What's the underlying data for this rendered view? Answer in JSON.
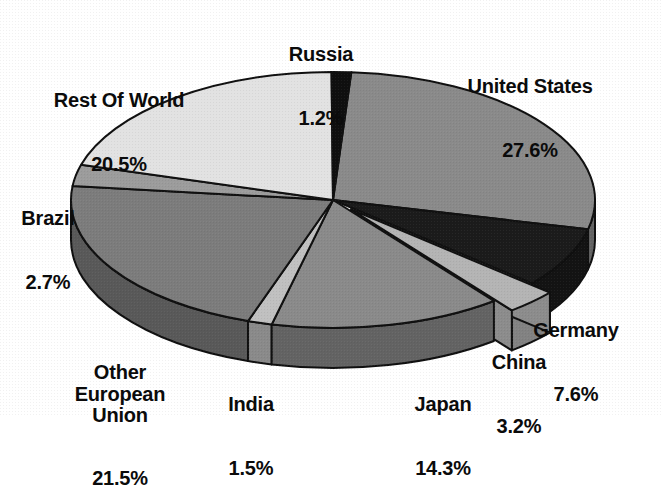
{
  "chart_title": "",
  "chart_data": {
    "type": "pie",
    "title": "",
    "subtitle": "",
    "xlabel": "",
    "ylabel": "",
    "units": "percent",
    "legend_position": "none",
    "labels_outside": true,
    "three_d": true,
    "grid": false,
    "start_angle_deg": 4,
    "direction": "clockwise",
    "categories": [
      "United States",
      "Germany",
      "China",
      "Japan",
      "India",
      "Other European Union",
      "Brazil",
      "Rest Of World",
      "Russia"
    ],
    "values": [
      27.6,
      7.6,
      3.2,
      14.3,
      1.5,
      21.5,
      2.7,
      20.5,
      1.2
    ],
    "total": 100.1,
    "slices": [
      {
        "name": "United States",
        "value": 27.6,
        "label": "United States",
        "percent_text": "27.6%",
        "fill": "#8a8a8a",
        "exploded": false
      },
      {
        "name": "Germany",
        "value": 7.6,
        "label": "Germany",
        "percent_text": "7.6%",
        "fill": "#1b1b1b",
        "exploded": false
      },
      {
        "name": "China",
        "value": 3.2,
        "label": "China",
        "percent_text": "3.2%",
        "fill": "#b4b4b4",
        "exploded": true
      },
      {
        "name": "Japan",
        "value": 14.3,
        "label": "Japan",
        "percent_text": "14.3%",
        "fill": "#8a8a8a",
        "exploded": false
      },
      {
        "name": "India",
        "value": 1.5,
        "label": "India",
        "percent_text": "1.5%",
        "fill": "#c0c0c0",
        "exploded": false
      },
      {
        "name": "Other European Union",
        "value": 21.5,
        "label": "Other\nEuropean\nUnion",
        "percent_text": "21.5%",
        "fill": "#7c7c7c",
        "exploded": false
      },
      {
        "name": "Brazil",
        "value": 2.7,
        "label": "Brazil",
        "percent_text": "2.7%",
        "fill": "#9c9c9c",
        "exploded": false
      },
      {
        "name": "Rest Of World",
        "value": 20.5,
        "label": "Rest Of World",
        "percent_text": "20.5%",
        "fill": "#e2e2e2",
        "exploded": false
      },
      {
        "name": "Russia",
        "value": 1.2,
        "label": "Russia",
        "percent_text": "1.2%",
        "fill": "#0f0f0f",
        "exploded": false
      }
    ]
  },
  "labels": {
    "united_states": {
      "name": "United States",
      "pct": "27.6%"
    },
    "germany": {
      "name": "Germany",
      "pct": "7.6%"
    },
    "china": {
      "name": "China",
      "pct": "3.2%"
    },
    "japan": {
      "name": "Japan",
      "pct": "14.3%"
    },
    "india": {
      "name": "India",
      "pct": "1.5%"
    },
    "other_eu": {
      "name": "Other\nEuropean\nUnion",
      "pct": "21.5%"
    },
    "brazil": {
      "name": "Brazil",
      "pct": "2.7%"
    },
    "rest_of_world": {
      "name": "Rest Of World",
      "pct": "20.5%"
    },
    "russia": {
      "name": "Russia",
      "pct": "1.2%"
    }
  },
  "colors": {
    "background": "#ffffff",
    "text": "#0b0b0b",
    "outline": "#101010"
  }
}
